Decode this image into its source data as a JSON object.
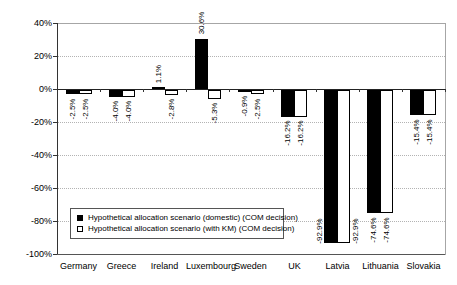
{
  "chart_data": {
    "type": "bar",
    "title": "",
    "xlabel": "",
    "ylabel": "",
    "categories": [
      "Germany",
      "Greece",
      "Ireland",
      "Luxembourg",
      "Sweden",
      "UK",
      "Latvia",
      "Lithuania",
      "Slovakia"
    ],
    "series": [
      {
        "name": "Hypothetical allocation scenario (domestic) (COM decision)",
        "marker": "filled-square",
        "color": "#000000",
        "values": [
          -2.5,
          -4.0,
          1.1,
          30.6,
          -0.9,
          -16.2,
          -92.9,
          -74.6,
          -15.4
        ],
        "value_labels": [
          "-2.5%",
          "-4.0%",
          "1.1%",
          "30.6%",
          "-0.9%",
          "-16.2%",
          "-92.9%",
          "-74.6%",
          "-15.4%"
        ]
      },
      {
        "name": "Hypothetical allocation scenario (with KM) (COM decision)",
        "marker": "open-square",
        "color": "#ffffff",
        "values": [
          -2.5,
          -4.0,
          -2.8,
          -5.3,
          -2.5,
          -16.2,
          -92.9,
          -74.6,
          -15.4
        ],
        "value_labels": [
          "-2.5%",
          "-4.0%",
          "-2.8%",
          "-5.3%",
          "-2.5%",
          "-16.2%",
          "-92.9%",
          "-74.6%",
          "-15.4%"
        ]
      }
    ],
    "ylim": [
      -100,
      40
    ],
    "ytick_values": [
      40,
      20,
      0,
      -20,
      -40,
      -60,
      -80,
      -100
    ],
    "ytick_labels": [
      "40%",
      "20%",
      "0%",
      "-20%",
      "-40%",
      "-60%",
      "-80%",
      "-100%"
    ],
    "grid": "horizontal-dotted",
    "legend_position": "inside-bottom-left",
    "colors": {
      "bar_fill_series1": "#000000",
      "bar_fill_series2": "#ffffff",
      "bar_border": "#000000",
      "gridline": "#b3b3b3",
      "axis": "#333333",
      "plot_border": "#a6a6a6",
      "background": "#ffffff",
      "text": "#000000"
    }
  }
}
